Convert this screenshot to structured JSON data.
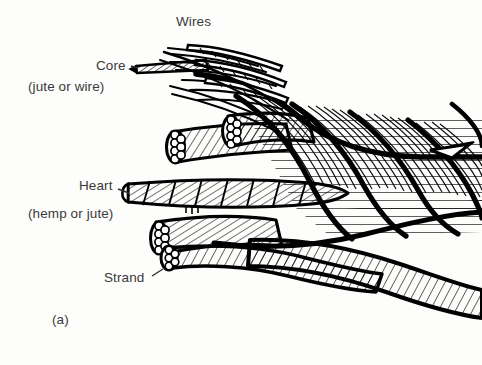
{
  "figure": {
    "kind": "technical-line-drawing",
    "background_color": "#fdfdfc",
    "ink_color": "#000000",
    "text_color": "#3a3a3a"
  },
  "labels": {
    "wires": "Wires",
    "core": "Core",
    "core_sub": "(jute or wire)",
    "heart": "Heart",
    "heart_sub": "(hemp or jute)",
    "strand": "Strand",
    "figure_letter": "(a)"
  }
}
